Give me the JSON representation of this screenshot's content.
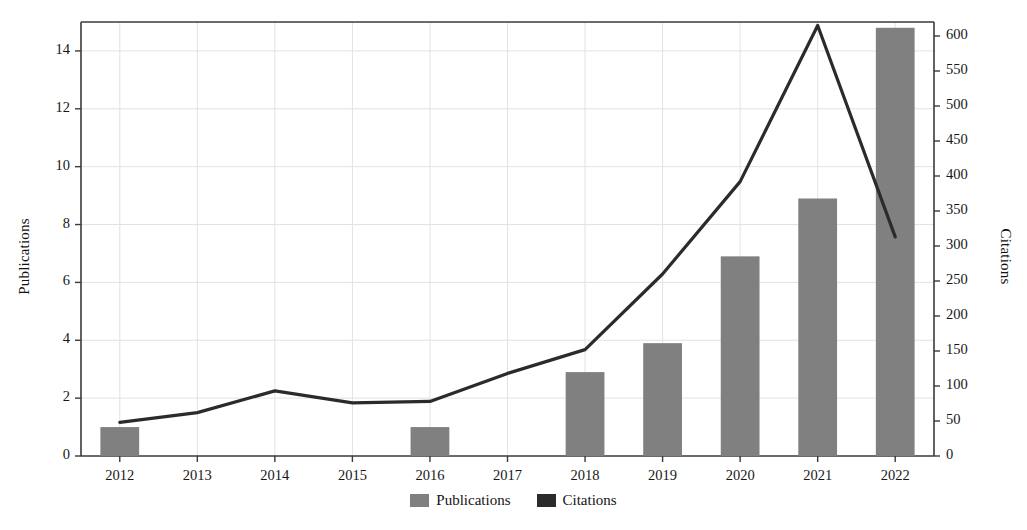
{
  "chart_data": {
    "type": "bar",
    "title": "",
    "xlabel": "",
    "ylabel": "Publications",
    "y2label": "Citations",
    "categories": [
      "2012",
      "2013",
      "2014",
      "2015",
      "2016",
      "2017",
      "2018",
      "2019",
      "2020",
      "2021",
      "2022"
    ],
    "ylim": [
      0,
      15
    ],
    "y2lim": [
      0,
      620
    ],
    "yticks": [
      0,
      2,
      4,
      6,
      8,
      10,
      12,
      14
    ],
    "y2ticks": [
      0,
      50,
      100,
      150,
      200,
      250,
      300,
      350,
      400,
      450,
      500,
      550,
      600
    ],
    "grid": true,
    "legend_position": "bottom",
    "series": [
      {
        "name": "Publications",
        "kind": "bar",
        "axis": "left",
        "color": "#808080",
        "values": [
          1,
          0,
          0,
          0,
          1,
          0,
          2.9,
          3.9,
          6.9,
          8.9,
          14.8
        ]
      },
      {
        "name": "Citations",
        "kind": "line",
        "axis": "right",
        "color": "#2b2b2b",
        "values": [
          48,
          62,
          93,
          76,
          78,
          118,
          152,
          260,
          392,
          615,
          313
        ]
      }
    ]
  },
  "axes": {
    "left_title": "Publications",
    "right_title": "Citations",
    "left_ticks": [
      "0",
      "2",
      "4",
      "6",
      "8",
      "10",
      "12",
      "14"
    ],
    "right_ticks": [
      "0",
      "50",
      "100",
      "150",
      "200",
      "250",
      "300",
      "350",
      "400",
      "450",
      "500",
      "550",
      "600"
    ],
    "x_ticks": [
      "2012",
      "2013",
      "2014",
      "2015",
      "2016",
      "2017",
      "2018",
      "2019",
      "2020",
      "2021",
      "2022"
    ]
  },
  "legend": {
    "items": [
      {
        "label": "Publications",
        "color": "#808080"
      },
      {
        "label": "Citations",
        "color": "#2b2b2b"
      }
    ]
  },
  "colors": {
    "bar": "#808080",
    "line": "#2b2b2b",
    "grid": "#e2e2e2",
    "axis": "#3a3a3a",
    "background": "#ffffff"
  }
}
